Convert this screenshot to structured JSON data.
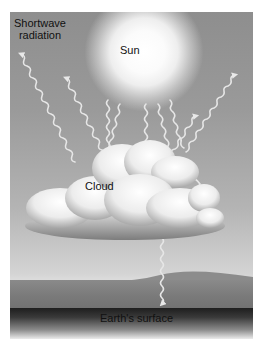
{
  "diagram": {
    "type": "shortwave radiation interaction with clouds",
    "labels": {
      "shortwave_radiation_line1": "Shortwave",
      "shortwave_radiation_line2": "radiation",
      "sun": "Sun",
      "cloud": "Cloud",
      "earth_surface": "Earth's surface"
    },
    "elements": [
      {
        "name": "sun",
        "description": "glowing white sun at top center"
      },
      {
        "name": "cloud",
        "description": "white cumulus cloud in middle"
      },
      {
        "name": "earth-surface",
        "description": "dark ground at bottom"
      },
      {
        "name": "radiation-rays",
        "description": "wavy white arrows representing shortwave radiation, reflected by cloud back to space, one transmitted to the surface"
      }
    ],
    "colors": {
      "sky_top": "#8e8e8e",
      "sky_bottom": "#d4d4d4",
      "sun": "#ffffff",
      "cloud": "#f4f4f4",
      "ground": "#7a7a7a",
      "ray": "#e6e6e6"
    }
  }
}
